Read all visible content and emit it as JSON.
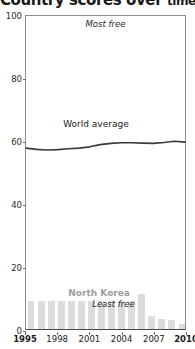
{
  "title": {
    "main": "Country scores over",
    "tail": "time"
  },
  "annotations": {
    "most_free": "Most free",
    "least_free": "Least free"
  },
  "chart_data": {
    "type": "line",
    "title": "Country scores over time",
    "xlabel": "",
    "ylabel": "",
    "xlim": [
      1995,
      2010
    ],
    "ylim": [
      0,
      100
    ],
    "grid": false,
    "legend": "inline-annotations",
    "y_ticks": [
      0,
      20,
      40,
      60,
      80,
      100
    ],
    "y_tick_labels": [
      "0",
      "20",
      "40",
      "60",
      "80",
      "100"
    ],
    "x_ticks": [
      1995,
      1998,
      2001,
      2004,
      2007,
      2010
    ],
    "x_tick_labels": [
      "1995",
      "1998",
      "2001",
      "2004",
      "2007",
      "2010"
    ],
    "x_tick_bold": [
      true,
      false,
      false,
      false,
      false,
      true
    ],
    "series": [
      {
        "name": "World average",
        "type": "line",
        "color": "#3a3a3a",
        "x": [
          1995,
          1996,
          1997,
          1998,
          1999,
          2000,
          2001,
          2002,
          2003,
          2004,
          2005,
          2006,
          2007,
          2008,
          2009,
          2010
        ],
        "values": [
          57.8,
          57.4,
          57.2,
          57.3,
          57.6,
          57.8,
          58.2,
          58.9,
          59.3,
          59.5,
          59.5,
          59.4,
          59.3,
          59.6,
          60.0,
          59.7
        ]
      },
      {
        "name": "North Korea",
        "type": "bar",
        "color": "#dcdcdc",
        "x": [
          1995,
          1996,
          1997,
          1998,
          1999,
          2000,
          2001,
          2002,
          2003,
          2004,
          2005,
          2006,
          2007,
          2008,
          2009,
          2010
        ],
        "values": [
          9.0,
          9.0,
          9.0,
          9.0,
          9.0,
          9.0,
          9.0,
          9.0,
          9.0,
          9.0,
          9.0,
          11.0,
          4.0,
          3.2,
          3.0,
          1.5
        ]
      }
    ]
  }
}
